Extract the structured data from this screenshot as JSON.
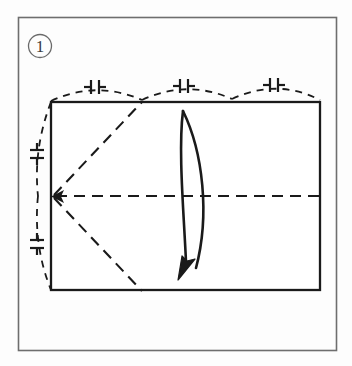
{
  "figure": {
    "type": "origami-diagram",
    "step_label": "1",
    "step_label_style": "circled-number",
    "caption": "",
    "background_color": "#fdfdfd",
    "frame": {
      "name": "outer-frame",
      "x": 18,
      "y": 17,
      "width": 319,
      "height": 334,
      "stroke": "#6e6e6e",
      "stroke_width": 1.6
    },
    "paper": {
      "name": "paper-rectangle",
      "x": 51,
      "y": 102,
      "width": 269,
      "height": 188,
      "stroke": "#1a1a1a",
      "stroke_width": 2.2,
      "fill": "#ffffff"
    },
    "creases": [
      {
        "name": "center-horizontal-crease",
        "kind": "valley-dashed",
        "from": [
          51,
          196
        ],
        "to": [
          320,
          196
        ],
        "stroke": "#1a1a1a"
      },
      {
        "name": "upper-diagonal-crease",
        "kind": "valley-dashed",
        "from": [
          52,
          196
        ],
        "to": [
          142,
          102
        ],
        "stroke": "#1a1a1a"
      },
      {
        "name": "lower-diagonal-crease",
        "kind": "valley-dashed",
        "from": [
          52,
          196
        ],
        "to": [
          142,
          290
        ],
        "stroke": "#1a1a1a"
      }
    ],
    "reference_arcs": [
      {
        "name": "top-equal-measure-arc",
        "kind": "dashed-arc",
        "from": [
          51,
          100
        ],
        "to": [
          320,
          100
        ],
        "bulge": "up",
        "tick_marks": 3
      },
      {
        "name": "left-equal-measure-arc",
        "kind": "dashed-arc",
        "from": [
          51,
          102
        ],
        "to": [
          51,
          290
        ],
        "bulge": "left",
        "tick_marks": 2
      }
    ],
    "tick_symbol": {
      "name": "equal-length-tick",
      "glyph": "dashed-bar-pair",
      "description": "two short bars with perpendicular end ticks marking equal divisions",
      "count_top": 3,
      "count_left": 2
    },
    "arrows": [
      {
        "name": "fold-arrow-main",
        "kind": "curved-fold-arrow",
        "start": [
          183,
          110
        ],
        "end": [
          183,
          276
        ],
        "direction": "down-left",
        "style": "solid-hollow-curve",
        "stroke": "#1a1a1a"
      },
      {
        "name": "crease-convergence-arrow",
        "kind": "small-arrowhead",
        "at": [
          52,
          197
        ],
        "direction": "left",
        "stroke": "#1a1a1a"
      }
    ],
    "colors": {
      "ink": "#1a1a1a",
      "frame": "#6e6e6e",
      "paper_fill": "#ffffff",
      "page": "#fdfdfd"
    }
  }
}
